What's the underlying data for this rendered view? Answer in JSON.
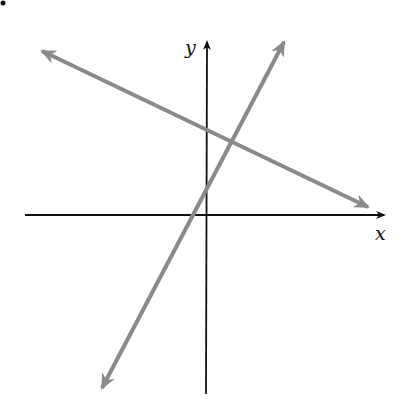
{
  "diagram": {
    "title": "",
    "axes": {
      "x_label": "x",
      "y_label": "y",
      "color": "#111111"
    },
    "lines": [
      {
        "name": "negative-slope-line",
        "slope_sign": "negative",
        "color": "#8a8a8a"
      },
      {
        "name": "positive-slope-line",
        "slope_sign": "positive",
        "color": "#8a8a8a"
      }
    ]
  }
}
